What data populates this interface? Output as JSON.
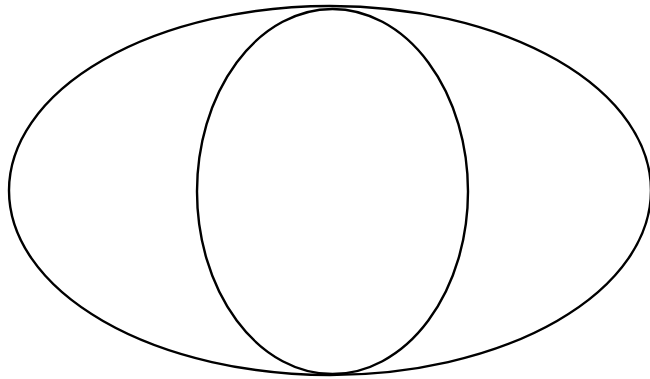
{
  "figure": {
    "kind": "venn-diagram",
    "title": "",
    "width": 650,
    "height": 379,
    "background_color": "#FFFFFF",
    "stroke_color": "#000000",
    "stroke_width": 2.4,
    "fill": "none",
    "region_labels": [],
    "annotations": []
  },
  "shapes": [
    {
      "id": "set-a",
      "name": "large-ellipse",
      "type": "ellipse",
      "cx": 330,
      "cy": 190.5,
      "rx": 321,
      "ry": 184.5,
      "stroke_color": "#000000",
      "stroke_width": 2.4,
      "fill": "none",
      "label": ""
    },
    {
      "id": "set-b",
      "name": "small-ellipse",
      "type": "ellipse",
      "cx": 332.5,
      "cy": 191.5,
      "rx": 135.5,
      "ry": 182.5,
      "stroke_color": "#000000",
      "stroke_width": 2.4,
      "fill": "none",
      "label": ""
    }
  ],
  "intersections": [
    {
      "name": "top-crossing",
      "x": 326,
      "y": 14
    },
    {
      "name": "bottom-crossing",
      "x": 327,
      "y": 357
    }
  ],
  "chart_data": {
    "type": "diagram",
    "diagram_type": "venn",
    "title": "",
    "xlabel": "",
    "ylabel": "",
    "set_count": 2,
    "sets": [
      {
        "name": "set-a",
        "label": "",
        "shape": "ellipse",
        "size": null
      },
      {
        "name": "set-b",
        "label": "",
        "shape": "ellipse",
        "size": null
      }
    ],
    "regions": [
      {
        "name": "a-only",
        "label": "",
        "value": null
      },
      {
        "name": "intersection-ab",
        "label": "",
        "value": null
      },
      {
        "name": "b-only",
        "label": "",
        "value": null
      }
    ],
    "legend": [],
    "grid": false
  }
}
